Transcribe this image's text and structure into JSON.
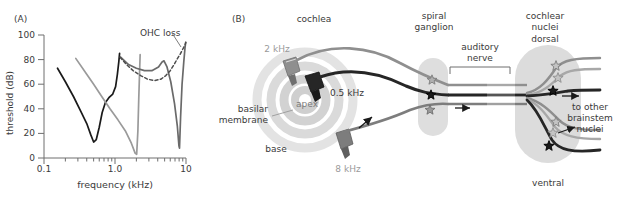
{
  "figure": {
    "panels": [
      {
        "id": "A",
        "label": "(A)"
      },
      {
        "id": "B",
        "label": "(B)"
      }
    ]
  },
  "colors": {
    "black": "#1a1a1a",
    "dark_gray": "#4d4d4d",
    "mid_gray": "#808080",
    "light_gray": "#b3b3b3",
    "pale_gray": "#cccccc",
    "blob_gray": "#d4d4d4",
    "spiral_gray": "#dddddd",
    "text": "#3a3a3a",
    "axis": "#6e6e6e"
  },
  "panelA": {
    "label": "(A)",
    "annotation": "OHC loss"
  },
  "chart_data": {
    "type": "line",
    "title": "",
    "xlabel": "frequency (kHz)",
    "ylabel": "threshold (dB)",
    "xscale": "log",
    "xlim": [
      0.1,
      10
    ],
    "ylim": [
      0,
      100
    ],
    "xticks": [
      0.1,
      1.0,
      10
    ],
    "xticklabels": [
      "0.1",
      "1.0",
      "10"
    ],
    "yticks": [
      0,
      20,
      40,
      60,
      80,
      100
    ],
    "yticklabels": [
      "0",
      "20",
      "40",
      "60",
      "80",
      "100"
    ],
    "grid": false,
    "legend": false,
    "annotations": [
      {
        "text": "OHC loss",
        "x": 4.2,
        "y": 93,
        "leader_to_x": 7.0,
        "leader_to_y": 78
      }
    ],
    "series": [
      {
        "name": "tuning curve 0.5 kHz (normal)",
        "color": "#1a1a1a",
        "style": "solid",
        "cf_khz": 0.5,
        "threshold_min_db": 13,
        "points": [
          [
            0.155,
            73
          ],
          [
            0.2,
            62
          ],
          [
            0.26,
            50
          ],
          [
            0.33,
            38
          ],
          [
            0.4,
            28
          ],
          [
            0.455,
            19
          ],
          [
            0.5,
            13
          ],
          [
            0.545,
            15
          ],
          [
            0.6,
            25
          ],
          [
            0.66,
            37
          ],
          [
            0.73,
            45
          ],
          [
            0.82,
            49
          ],
          [
            0.93,
            52
          ],
          [
            1.02,
            58
          ],
          [
            1.08,
            68
          ],
          [
            1.13,
            78
          ],
          [
            1.16,
            85
          ]
        ]
      },
      {
        "name": "tuning curve 2 kHz (normal)",
        "color": "#9a9a9a",
        "style": "solid",
        "cf_khz": 2.0,
        "threshold_min_db": 3,
        "points": [
          [
            0.28,
            81
          ],
          [
            0.38,
            70
          ],
          [
            0.5,
            60
          ],
          [
            0.65,
            50
          ],
          [
            0.85,
            40
          ],
          [
            1.1,
            31
          ],
          [
            1.4,
            22
          ],
          [
            1.7,
            12
          ],
          [
            1.92,
            4
          ],
          [
            2.02,
            3
          ],
          [
            2.1,
            22
          ],
          [
            2.16,
            48
          ],
          [
            2.22,
            70
          ],
          [
            2.26,
            84
          ]
        ]
      },
      {
        "name": "tuning curve 8 kHz (normal)",
        "color": "#6a6a6a",
        "style": "solid",
        "cf_khz": 8.0,
        "threshold_min_db": 8,
        "points": [
          [
            1.2,
            82
          ],
          [
            1.55,
            76
          ],
          [
            2.0,
            73
          ],
          [
            2.6,
            71
          ],
          [
            3.3,
            71
          ],
          [
            4.1,
            74
          ],
          [
            4.6,
            78
          ],
          [
            4.9,
            79
          ],
          [
            5.4,
            74
          ],
          [
            6.1,
            62
          ],
          [
            6.9,
            44
          ],
          [
            7.55,
            26
          ],
          [
            7.95,
            10
          ],
          [
            8.1,
            8
          ],
          [
            8.4,
            34
          ],
          [
            8.8,
            60
          ],
          [
            9.3,
            78
          ],
          [
            9.7,
            90
          ],
          [
            9.9,
            94
          ]
        ]
      },
      {
        "name": "OHC loss (elevated broad curve)",
        "color": "#4d4d4d",
        "style": "dashed",
        "cf_khz": 8.0,
        "threshold_min_db": 63,
        "points": [
          [
            1.18,
            82
          ],
          [
            1.45,
            76
          ],
          [
            1.8,
            71
          ],
          [
            2.3,
            67
          ],
          [
            2.9,
            64
          ],
          [
            3.6,
            63
          ],
          [
            4.4,
            64
          ],
          [
            5.2,
            67
          ],
          [
            6.0,
            71
          ],
          [
            6.8,
            76
          ],
          [
            7.6,
            81
          ],
          [
            8.4,
            85
          ],
          [
            9.1,
            89
          ],
          [
            9.7,
            92
          ],
          [
            9.95,
            94
          ]
        ]
      }
    ]
  },
  "panelB": {
    "label": "(B)",
    "headers": {
      "cochlea": "cochlea",
      "spiral_ganglion": "spiral\nganglion",
      "spiral_ganglion_line1": "spiral",
      "spiral_ganglion_line2": "ganglion",
      "cochlear_nuclei_line1": "cochlear",
      "cochlear_nuclei_line2": "nuclei"
    },
    "cochlea_labels": {
      "freq_2khz": "2 kHz",
      "freq_05khz": "0.5 kHz",
      "freq_8khz": "8 kHz",
      "apex": "apex",
      "base": "base",
      "basilar_line1": "basilar",
      "basilar_line2": "membrane"
    },
    "nerve_labels": {
      "auditory_line1": "auditory",
      "auditory_line2": "nerve"
    },
    "nuclei_labels": {
      "dorsal": "dorsal",
      "ventral": "ventral",
      "to_other_line1": "to other",
      "to_other_line2": "brainstem",
      "to_other_line3": "nuclei"
    },
    "fiber_count": 3,
    "ganglion_cell_count": 3,
    "nucleus_cell_count": 6
  }
}
